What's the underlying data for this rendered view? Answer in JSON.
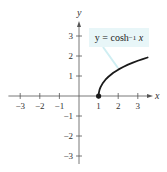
{
  "chart_data": {
    "type": "line",
    "title": "",
    "function": "y = cosh^-1 x",
    "annotation": {
      "prefix": "y = cosh",
      "superscript": "−1",
      "variable": "x"
    },
    "xlabel": "x",
    "ylabel": "y",
    "xlim": [
      -3.5,
      3.7
    ],
    "ylim": [
      -3.5,
      3.6
    ],
    "x_ticks": [
      -3,
      -2,
      -1,
      1,
      2,
      3
    ],
    "x_tick_labels": [
      "−3",
      "−2",
      "−1",
      "1",
      "2",
      "3"
    ],
    "y_ticks": [
      -3,
      -2,
      -1,
      1,
      2,
      3
    ],
    "y_tick_labels": [
      "−3",
      "−2",
      "−1",
      "1",
      "2",
      "3"
    ],
    "grid": false,
    "series": [
      {
        "name": "y = cosh^-1 x",
        "x": [
          1,
          1.01,
          1.05,
          1.1,
          1.2,
          1.35,
          1.5,
          1.75,
          2,
          2.25,
          2.5,
          2.75,
          3,
          3.25,
          3.5
        ],
        "y": [
          0,
          0.141,
          0.317,
          0.444,
          0.622,
          0.815,
          0.962,
          1.159,
          1.317,
          1.448,
          1.567,
          1.665,
          1.763,
          1.848,
          1.925
        ],
        "color": "#1a1a1a",
        "start_point": {
          "x": 1,
          "y": 0,
          "marker": "filled-circle"
        }
      }
    ]
  },
  "colors": {
    "axis": "#555555",
    "curve": "#1a1a1a",
    "label_bg": "#e8f6f8",
    "leader": "#cfeef2"
  }
}
